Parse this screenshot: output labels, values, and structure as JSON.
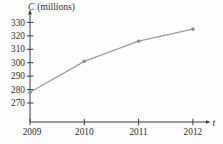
{
  "chart": {
    "ylabel_symbol": "C",
    "ylabel_units": "(millions)",
    "xlabel": "t"
  },
  "chart_data": {
    "type": "line",
    "title": "",
    "ylabel": "C (millions)",
    "xlabel": "t",
    "x": [
      2009,
      2010,
      2011,
      2012
    ],
    "values": [
      278,
      301,
      316,
      325
    ],
    "xticks": [
      2009,
      2010,
      2011,
      2012
    ],
    "yticks": [
      270,
      280,
      290,
      300,
      310,
      320,
      330
    ],
    "ylim": [
      256,
      337
    ],
    "xlim": [
      2009,
      2012.3
    ],
    "grid": false,
    "legend": "none",
    "line_color": "#9e9e9e",
    "marker_color": "#8f8f8f",
    "axis_color": "#3c3c3c",
    "text_color": "#2e2e2e"
  }
}
